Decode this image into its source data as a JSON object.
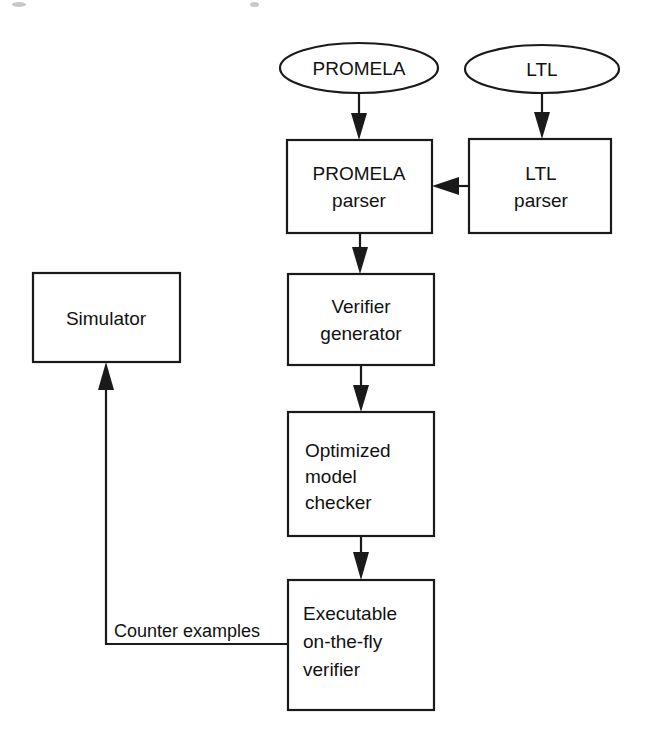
{
  "diagram": {
    "background_color": "#ffffff",
    "stroke_color": "#1a1a1a",
    "text_color": "#111111",
    "nodes": [
      {
        "id": "promela-input",
        "shape": "ellipse",
        "label": "PROMELA",
        "lines": [
          "PROMELA"
        ],
        "cx": 359,
        "cy": 68,
        "rx": 79,
        "ry": 25
      },
      {
        "id": "ltl-input",
        "shape": "ellipse",
        "label": "LTL",
        "lines": [
          "LTL"
        ],
        "cx": 542,
        "cy": 69,
        "rx": 77,
        "ry": 24
      },
      {
        "id": "promela-parser",
        "shape": "rect",
        "label": "PROMELA parser",
        "lines": [
          "PROMELA",
          "parser"
        ],
        "x": 287,
        "y": 140,
        "w": 145,
        "h": 93,
        "align": "center"
      },
      {
        "id": "ltl-parser",
        "shape": "rect",
        "label": "LTL parser",
        "lines": [
          "LTL",
          "parser"
        ],
        "x": 469,
        "y": 139,
        "w": 142,
        "h": 94,
        "align": "center"
      },
      {
        "id": "verifier-generator",
        "shape": "rect",
        "label": "Verifier generator",
        "lines": [
          "Verifier",
          "generator"
        ],
        "x": 288,
        "y": 274,
        "w": 146,
        "h": 91,
        "align": "center"
      },
      {
        "id": "optimized-model-checker",
        "shape": "rect",
        "label": "Optimized model checker",
        "lines": [
          "Optimized",
          "model",
          "checker"
        ],
        "x": 288,
        "y": 412,
        "w": 146,
        "h": 124,
        "align": "left"
      },
      {
        "id": "executable-verifier",
        "shape": "rect",
        "label": "Executable on-the-fly verifier",
        "lines": [
          "Executable",
          "on-the-fly",
          "verifier"
        ],
        "x": 288,
        "y": 580,
        "w": 146,
        "h": 130,
        "align": "left"
      },
      {
        "id": "simulator",
        "shape": "rect",
        "label": "Simulator",
        "lines": [
          "Simulator"
        ],
        "x": 33,
        "y": 273,
        "w": 147,
        "h": 89,
        "align": "center"
      }
    ],
    "edges": [
      {
        "id": "promela-input-to-parser",
        "from": "promela-input",
        "to": "promela-parser",
        "label": "",
        "direction": "down"
      },
      {
        "id": "ltl-input-to-ltl-parser",
        "from": "ltl-input",
        "to": "ltl-parser",
        "label": "",
        "direction": "down"
      },
      {
        "id": "ltl-parser-to-promela-parser",
        "from": "ltl-parser",
        "to": "promela-parser",
        "label": "",
        "direction": "left"
      },
      {
        "id": "promela-parser-to-verifier-generator",
        "from": "promela-parser",
        "to": "verifier-generator",
        "label": "",
        "direction": "down"
      },
      {
        "id": "verifier-generator-to-model-checker",
        "from": "verifier-generator",
        "to": "optimized-model-checker",
        "label": "",
        "direction": "down"
      },
      {
        "id": "model-checker-to-executable-verifier",
        "from": "optimized-model-checker",
        "to": "executable-verifier",
        "label": "",
        "direction": "down"
      },
      {
        "id": "executable-verifier-to-simulator",
        "from": "executable-verifier",
        "to": "simulator",
        "label": "Counter examples",
        "direction": "up"
      }
    ],
    "edge_labels": {
      "counter_examples": "Counter examples"
    }
  }
}
